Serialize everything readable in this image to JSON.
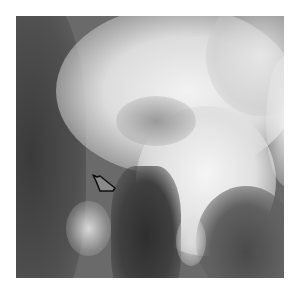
{
  "image": {
    "type": "radiograph",
    "description": "Grayscale X-ray image with an outlined arrow marker",
    "background_color": "#ffffff",
    "annotation": {
      "shape": "outlined-arrow",
      "color": "#111111",
      "pointing": "up-left"
    }
  }
}
